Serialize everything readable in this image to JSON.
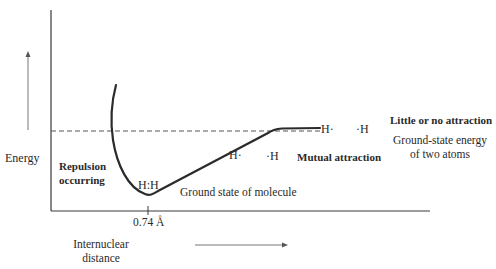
{
  "diagram": {
    "y_axis_label": "Energy",
    "x_axis_label_line1": "Internuclear",
    "x_axis_label_line2": "distance",
    "tick_label": "0.74 Å",
    "annotations": {
      "repulsion_line1": "Repulsion",
      "repulsion_line2": "occurring",
      "bond_molecule": "H:H",
      "ground_state_molecule": "Ground state of molecule",
      "mid_h_left": "H·",
      "mid_h_right": "·H",
      "mutual_attraction": "Mutual attraction",
      "far_h_left": "H·",
      "far_h_right": "·H",
      "little_attraction": "Little or no attraction",
      "ground_state_atoms_line1": "Ground-state energy",
      "ground_state_atoms_line2": "of two atoms"
    },
    "colors": {
      "curve": "#2b2b2b",
      "axis": "#3a3a3a",
      "dashed": "#555555",
      "arrow": "#777777"
    }
  }
}
